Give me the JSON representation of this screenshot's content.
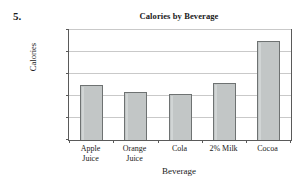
{
  "problem": {
    "number": "5."
  },
  "chart_data": {
    "type": "bar",
    "title": "Calories by Beverage",
    "xlabel": "Beverage",
    "ylabel": "Calories",
    "categories": [
      "Apple Juice",
      "Orange Juice",
      "Cola",
      "2% Milk",
      "Cocoa"
    ],
    "category_lines": [
      [
        "Apple",
        "Juice"
      ],
      [
        "Orange",
        "Juice"
      ],
      [
        "Cola",
        ""
      ],
      [
        "2% Milk",
        ""
      ],
      [
        "Cocoa",
        ""
      ]
    ],
    "values": [
      125,
      110,
      105,
      130,
      225
    ],
    "ylim": [
      0,
      250
    ],
    "ytick_labels": [
      "250",
      "200",
      "150",
      "100",
      "50",
      "0"
    ],
    "ytick_values": [
      250,
      200,
      150,
      100,
      50,
      0
    ],
    "grid": true,
    "legend": "none",
    "bar_fill_color": "#c2c6c6",
    "bar_edge_color": "#6e7272",
    "grid_color": "#c9c9c9",
    "axis_color": "#5a5a5a"
  }
}
